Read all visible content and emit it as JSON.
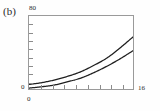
{
  "figure": {
    "panel_label": "(b)"
  },
  "chart_data": {
    "type": "line",
    "title": "",
    "subtitle": "",
    "xlabel": "",
    "ylabel": "",
    "xlim": [
      0,
      16
    ],
    "ylim": [
      0,
      80
    ],
    "grid": false,
    "legend": null,
    "axis": {
      "y_top_tick_label": "80",
      "y_bottom_tick_label": "0",
      "x_left_tick_label": "0",
      "x_right_tick_label": "16",
      "x_origin_label_below": "0",
      "y_tick_count": 8,
      "x_tick_count": 8,
      "tick_direction": "inward"
    },
    "x": [
      0,
      2,
      4,
      6,
      8,
      10,
      12,
      14,
      16
    ],
    "series": [
      {
        "name": "upper-curve",
        "color": "#1f1f1f",
        "values": [
          5,
          7,
          10,
          14,
          19,
          26,
          34,
          45,
          57
        ]
      },
      {
        "name": "lower-curve",
        "color": "#1f1f1f",
        "values": [
          1,
          2.5,
          4.5,
          8,
          12,
          18,
          25,
          33,
          42
        ]
      }
    ]
  }
}
